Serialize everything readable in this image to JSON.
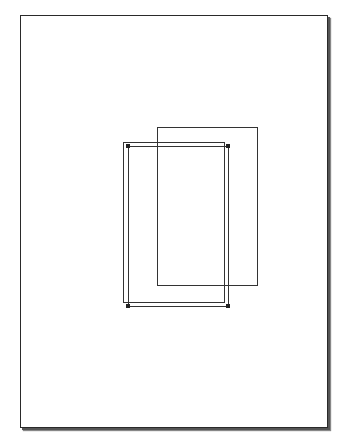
{
  "diagram": {
    "page": {
      "x": 20,
      "y": 15,
      "width": 306,
      "height": 411,
      "border_color": "#2a2a2a",
      "shadow": true
    },
    "shapes": [
      {
        "id": "rect-back-right",
        "x": 157,
        "y": 127,
        "width": 101,
        "height": 159,
        "selected": false
      },
      {
        "id": "rect-original",
        "x": 123,
        "y": 142,
        "width": 102,
        "height": 161,
        "selected": false
      },
      {
        "id": "rect-selected",
        "x": 128,
        "y": 146,
        "width": 101,
        "height": 161,
        "selected": true,
        "handles": [
          "top-left",
          "top-right",
          "bottom-left",
          "bottom-right"
        ]
      }
    ]
  }
}
